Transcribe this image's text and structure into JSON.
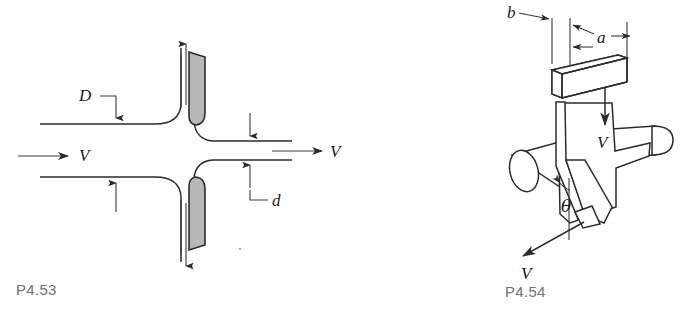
{
  "page": {
    "background_color": "#ffffff",
    "line_color": "#2b2b2b",
    "plate_fill_color": "#b8b8b8",
    "caption_color": "#6f6f6f",
    "width": 683,
    "height": 317
  },
  "figures": [
    {
      "id": "P4.53",
      "caption": "P4.53",
      "type": "engineering-diagram",
      "description": "Flow through a pipe with two shaded plates forming a sudden contraction; inlet diameter D, outlet diameter d",
      "labels": {
        "inlet_diameter": "D",
        "outlet_diameter": "d",
        "inlet_velocity": "V",
        "outlet_velocity": "V"
      }
    },
    {
      "id": "P4.54",
      "caption": "P4.54",
      "type": "engineering-diagram",
      "description": "Rectangular inlet duct of width a and thickness b feeding a bent nozzle on a horizontal pipe, discharging at angle theta",
      "labels": {
        "duct_thickness": "b",
        "duct_width": "a",
        "inlet_velocity": "V",
        "exit_velocity": "V",
        "jet_angle": "θ"
      }
    }
  ]
}
